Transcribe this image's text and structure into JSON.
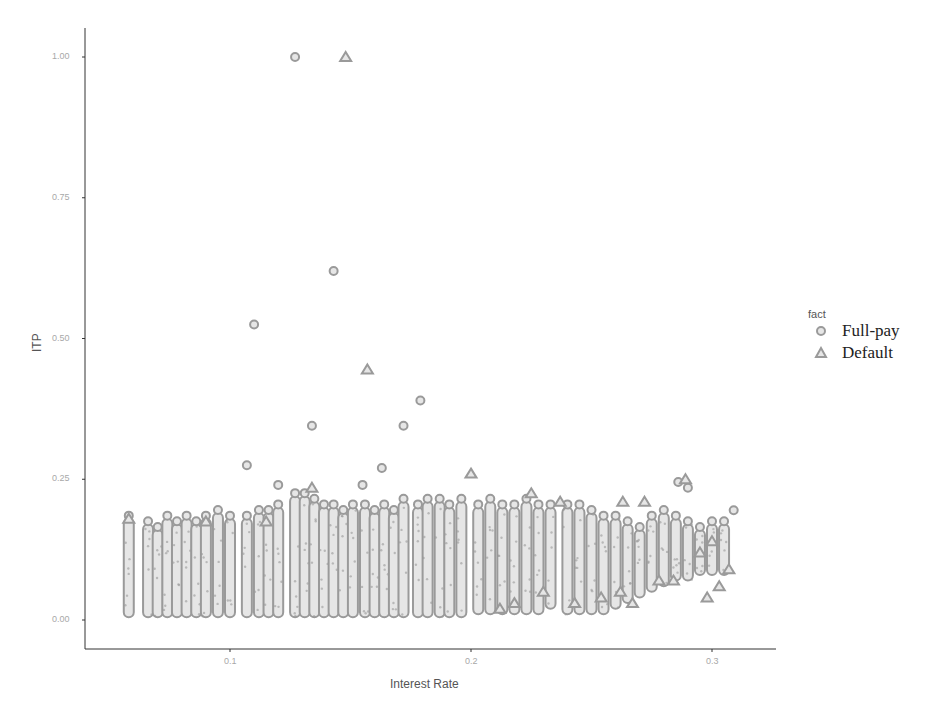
{
  "chart_data": {
    "type": "scatter",
    "title": "",
    "xlabel": "Interest Rate",
    "ylabel": "ITP",
    "xlim": [
      0.045,
      0.32
    ],
    "ylim": [
      -0.05,
      1.05
    ],
    "x_ticks": [
      0.1,
      0.2,
      0.3
    ],
    "x_tick_labels": [
      "0.1",
      "0.2",
      "0.3"
    ],
    "y_ticks": [
      0.0,
      0.25,
      0.5,
      0.75,
      1.0
    ],
    "y_tick_labels": [
      "0.00",
      "0.25",
      "0.50",
      "0.75",
      "1.00"
    ],
    "grid": false,
    "legend": {
      "title": "fact",
      "position": "right",
      "entries": [
        {
          "label": "Full-pay",
          "shape": "circle"
        },
        {
          "label": "Default",
          "shape": "triangle"
        }
      ]
    },
    "marker_color": "#9a9a9a",
    "marker_fill": "#e6e6e6",
    "series": [
      {
        "name": "Full-pay",
        "shape": "circle",
        "outliers": [
          {
            "x": 0.127,
            "y": 1.0
          },
          {
            "x": 0.143,
            "y": 0.62
          },
          {
            "x": 0.11,
            "y": 0.525
          },
          {
            "x": 0.179,
            "y": 0.39
          },
          {
            "x": 0.134,
            "y": 0.345
          },
          {
            "x": 0.172,
            "y": 0.345
          },
          {
            "x": 0.163,
            "y": 0.27
          },
          {
            "x": 0.107,
            "y": 0.275
          },
          {
            "x": 0.12,
            "y": 0.24
          },
          {
            "x": 0.155,
            "y": 0.24
          },
          {
            "x": 0.286,
            "y": 0.245
          },
          {
            "x": 0.29,
            "y": 0.235
          },
          {
            "x": 0.309,
            "y": 0.195
          }
        ],
        "dense_bands": [
          {
            "x": 0.058,
            "y_min": 0.005,
            "y_max": 0.18
          },
          {
            "x": 0.066,
            "y_min": 0.005,
            "y_max": 0.17
          },
          {
            "x": 0.07,
            "y_min": 0.005,
            "y_max": 0.16
          },
          {
            "x": 0.074,
            "y_min": 0.005,
            "y_max": 0.18
          },
          {
            "x": 0.078,
            "y_min": 0.005,
            "y_max": 0.17
          },
          {
            "x": 0.082,
            "y_min": 0.005,
            "y_max": 0.18
          },
          {
            "x": 0.086,
            "y_min": 0.005,
            "y_max": 0.17
          },
          {
            "x": 0.09,
            "y_min": 0.005,
            "y_max": 0.18
          },
          {
            "x": 0.095,
            "y_min": 0.005,
            "y_max": 0.19
          },
          {
            "x": 0.1,
            "y_min": 0.005,
            "y_max": 0.18
          },
          {
            "x": 0.107,
            "y_min": 0.005,
            "y_max": 0.18
          },
          {
            "x": 0.112,
            "y_min": 0.005,
            "y_max": 0.19
          },
          {
            "x": 0.116,
            "y_min": 0.005,
            "y_max": 0.19
          },
          {
            "x": 0.12,
            "y_min": 0.005,
            "y_max": 0.2
          },
          {
            "x": 0.127,
            "y_min": 0.005,
            "y_max": 0.22
          },
          {
            "x": 0.131,
            "y_min": 0.005,
            "y_max": 0.22
          },
          {
            "x": 0.135,
            "y_min": 0.005,
            "y_max": 0.21
          },
          {
            "x": 0.139,
            "y_min": 0.005,
            "y_max": 0.2
          },
          {
            "x": 0.143,
            "y_min": 0.005,
            "y_max": 0.2
          },
          {
            "x": 0.147,
            "y_min": 0.005,
            "y_max": 0.19
          },
          {
            "x": 0.151,
            "y_min": 0.005,
            "y_max": 0.2
          },
          {
            "x": 0.156,
            "y_min": 0.005,
            "y_max": 0.2
          },
          {
            "x": 0.16,
            "y_min": 0.005,
            "y_max": 0.19
          },
          {
            "x": 0.164,
            "y_min": 0.005,
            "y_max": 0.2
          },
          {
            "x": 0.168,
            "y_min": 0.005,
            "y_max": 0.19
          },
          {
            "x": 0.172,
            "y_min": 0.005,
            "y_max": 0.21
          },
          {
            "x": 0.178,
            "y_min": 0.005,
            "y_max": 0.2
          },
          {
            "x": 0.182,
            "y_min": 0.005,
            "y_max": 0.21
          },
          {
            "x": 0.187,
            "y_min": 0.005,
            "y_max": 0.21
          },
          {
            "x": 0.191,
            "y_min": 0.005,
            "y_max": 0.2
          },
          {
            "x": 0.196,
            "y_min": 0.005,
            "y_max": 0.21
          },
          {
            "x": 0.203,
            "y_min": 0.01,
            "y_max": 0.2
          },
          {
            "x": 0.208,
            "y_min": 0.01,
            "y_max": 0.21
          },
          {
            "x": 0.213,
            "y_min": 0.01,
            "y_max": 0.2
          },
          {
            "x": 0.218,
            "y_min": 0.01,
            "y_max": 0.2
          },
          {
            "x": 0.223,
            "y_min": 0.01,
            "y_max": 0.21
          },
          {
            "x": 0.228,
            "y_min": 0.01,
            "y_max": 0.2
          },
          {
            "x": 0.233,
            "y_min": 0.02,
            "y_max": 0.2
          },
          {
            "x": 0.24,
            "y_min": 0.01,
            "y_max": 0.2
          },
          {
            "x": 0.245,
            "y_min": 0.01,
            "y_max": 0.2
          },
          {
            "x": 0.25,
            "y_min": 0.01,
            "y_max": 0.19
          },
          {
            "x": 0.255,
            "y_min": 0.01,
            "y_max": 0.18
          },
          {
            "x": 0.26,
            "y_min": 0.02,
            "y_max": 0.18
          },
          {
            "x": 0.265,
            "y_min": 0.03,
            "y_max": 0.17
          },
          {
            "x": 0.27,
            "y_min": 0.04,
            "y_max": 0.16
          },
          {
            "x": 0.275,
            "y_min": 0.05,
            "y_max": 0.18
          },
          {
            "x": 0.28,
            "y_min": 0.06,
            "y_max": 0.19
          },
          {
            "x": 0.285,
            "y_min": 0.07,
            "y_max": 0.18
          },
          {
            "x": 0.29,
            "y_min": 0.07,
            "y_max": 0.17
          },
          {
            "x": 0.295,
            "y_min": 0.08,
            "y_max": 0.16
          },
          {
            "x": 0.3,
            "y_min": 0.08,
            "y_max": 0.17
          },
          {
            "x": 0.305,
            "y_min": 0.08,
            "y_max": 0.17
          }
        ]
      },
      {
        "name": "Default",
        "shape": "triangle",
        "outliers": [
          {
            "x": 0.148,
            "y": 1.0
          },
          {
            "x": 0.157,
            "y": 0.445
          },
          {
            "x": 0.2,
            "y": 0.26
          },
          {
            "x": 0.289,
            "y": 0.25
          },
          {
            "x": 0.263,
            "y": 0.21
          },
          {
            "x": 0.272,
            "y": 0.21
          },
          {
            "x": 0.134,
            "y": 0.235
          },
          {
            "x": 0.237,
            "y": 0.21
          },
          {
            "x": 0.225,
            "y": 0.225
          },
          {
            "x": 0.298,
            "y": 0.04
          },
          {
            "x": 0.303,
            "y": 0.06
          },
          {
            "x": 0.278,
            "y": 0.07
          },
          {
            "x": 0.284,
            "y": 0.07
          },
          {
            "x": 0.267,
            "y": 0.03
          },
          {
            "x": 0.262,
            "y": 0.05
          },
          {
            "x": 0.254,
            "y": 0.04
          },
          {
            "x": 0.243,
            "y": 0.03
          },
          {
            "x": 0.23,
            "y": 0.05
          },
          {
            "x": 0.218,
            "y": 0.03
          },
          {
            "x": 0.212,
            "y": 0.02
          },
          {
            "x": 0.307,
            "y": 0.09
          },
          {
            "x": 0.295,
            "y": 0.12
          },
          {
            "x": 0.3,
            "y": 0.14
          },
          {
            "x": 0.115,
            "y": 0.175
          },
          {
            "x": 0.09,
            "y": 0.175
          },
          {
            "x": 0.058,
            "y": 0.18
          }
        ]
      }
    ]
  }
}
